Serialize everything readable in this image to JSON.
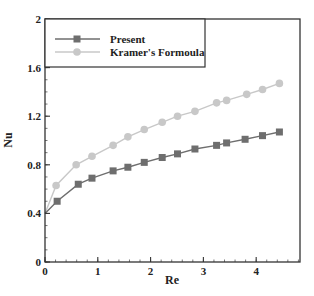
{
  "chart_data": {
    "type": "line",
    "title": "",
    "xlabel": "Re",
    "ylabel": "Nu",
    "xlim": [
      0,
      4.83
    ],
    "ylim": [
      0,
      2
    ],
    "xticks": [
      0,
      1,
      2,
      3,
      4
    ],
    "xtick_labels": [
      "0",
      "1",
      "2",
      "3",
      "4"
    ],
    "yticks": [
      0,
      0.4,
      0.8,
      1.2,
      1.6,
      2
    ],
    "ytick_labels": [
      "0",
      "0.4",
      "0.8",
      "1.2",
      "1.6",
      "2"
    ],
    "grid": false,
    "legend_position": "upper left (boxed)",
    "series": [
      {
        "name": "Present",
        "marker": "square",
        "color": "#6e6e6e",
        "x": [
          0,
          0.23,
          0.63,
          0.89,
          1.29,
          1.57,
          1.88,
          2.22,
          2.51,
          2.84,
          3.25,
          3.44,
          3.79,
          4.12,
          4.44
        ],
        "y": [
          0.4,
          0.5,
          0.64,
          0.69,
          0.75,
          0.78,
          0.82,
          0.86,
          0.89,
          0.93,
          0.96,
          0.98,
          1.01,
          1.04,
          1.07
        ]
      },
      {
        "name": "Kramer's Formoula",
        "marker": "circle",
        "color": "#c8c8c8",
        "x": [
          0,
          0.21,
          0.59,
          0.89,
          1.29,
          1.57,
          1.88,
          2.22,
          2.51,
          2.84,
          3.25,
          3.44,
          3.82,
          4.12,
          4.44
        ],
        "y": [
          0.4,
          0.63,
          0.8,
          0.87,
          0.96,
          1.03,
          1.09,
          1.15,
          1.2,
          1.24,
          1.31,
          1.33,
          1.38,
          1.42,
          1.47
        ]
      }
    ]
  }
}
